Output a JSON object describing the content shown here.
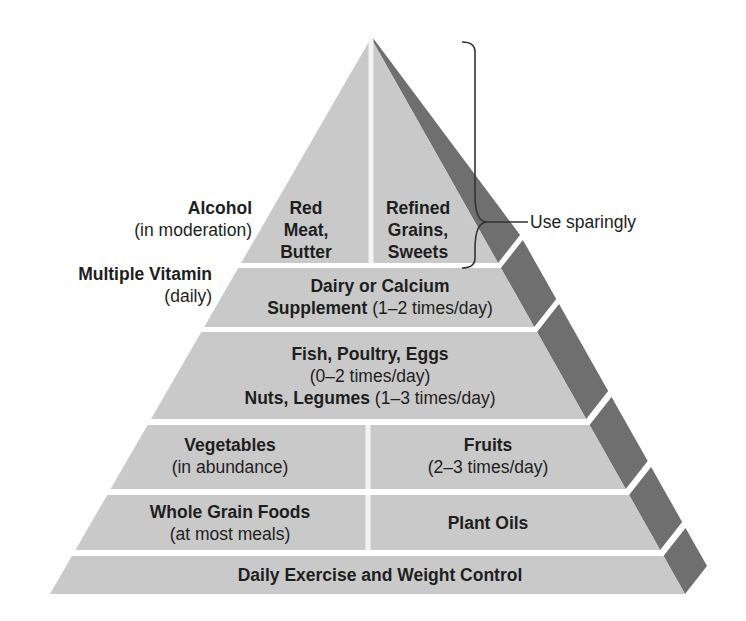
{
  "diagram": {
    "type": "food-pyramid",
    "colors": {
      "front": "#c9c9c9",
      "shadow": "#6f6f6f",
      "gap": "#f4f4f4",
      "text": "#1e1e1e"
    },
    "tiers": [
      {
        "level": 1,
        "cells": [
          {
            "title_lines": [
              "Red",
              "Meat,",
              "Butter"
            ],
            "note": ""
          },
          {
            "title_lines": [
              "Refined",
              "Grains,",
              "Sweets"
            ],
            "note": ""
          }
        ]
      },
      {
        "level": 2,
        "cells": [
          {
            "title": "Dairy or Calcium",
            "title2": "Supplement",
            "note": "(1–2 times/day)"
          }
        ]
      },
      {
        "level": 3,
        "cells": [
          {
            "title": "Fish, Poultry, Eggs",
            "note": "(0–2 times/day)",
            "title2": "Nuts, Legumes",
            "note2": "(1–3 times/day)"
          }
        ]
      },
      {
        "level": 4,
        "cells": [
          {
            "title": "Vegetables",
            "note": "(in abundance)"
          },
          {
            "title": "Fruits",
            "note": "(2–3 times/day)"
          }
        ]
      },
      {
        "level": 5,
        "cells": [
          {
            "title": "Whole Grain Foods",
            "note": "(at most meals)"
          },
          {
            "title": "Plant Oils",
            "note": ""
          }
        ]
      },
      {
        "level": 6,
        "cells": [
          {
            "title": "Daily Exercise and Weight Control",
            "note": ""
          }
        ]
      }
    ],
    "side_labels": [
      {
        "title": "Alcohol",
        "note": "(in moderation)"
      },
      {
        "title": "Multiple Vitamin",
        "note": "(daily)"
      }
    ],
    "bracket_label": "Use sparingly"
  }
}
